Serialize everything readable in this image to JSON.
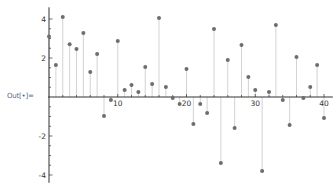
{
  "cell": {
    "output_label": "Out[•]="
  },
  "chart_data": {
    "type": "scatter",
    "style": "stem",
    "title": "",
    "xlabel": "",
    "ylabel": "",
    "xlim": [
      0,
      41
    ],
    "ylim": [
      -4.4,
      4.6
    ],
    "x_ticks": [
      10,
      20,
      30,
      40
    ],
    "y_ticks": [
      -4,
      -2,
      2,
      4
    ],
    "grid": false,
    "legend": null,
    "point_color": "#6e6e6e",
    "stem_color": "#c8c8c8",
    "x": [
      0,
      1,
      2,
      3,
      4,
      5,
      6,
      7,
      8,
      9,
      10,
      11,
      12,
      13,
      14,
      15,
      16,
      17,
      18,
      19,
      20,
      21,
      22,
      23,
      24,
      25,
      26,
      27,
      28,
      29,
      30,
      31,
      32,
      33,
      34,
      35,
      36,
      37,
      38,
      39,
      40
    ],
    "values": [
      3.1,
      1.64,
      4.1,
      2.7,
      2.46,
      3.28,
      1.28,
      2.2,
      -0.97,
      -0.15,
      2.87,
      0.36,
      0.62,
      0.26,
      1.54,
      0.67,
      4.05,
      0.51,
      -0.05,
      -0.36,
      1.44,
      -1.38,
      -0.36,
      -0.82,
      3.49,
      -3.38,
      1.9,
      -1.59,
      2.67,
      1.03,
      0.36,
      -3.79,
      0.26,
      3.69,
      -0.15,
      -1.44,
      2.05,
      -0.05,
      0.51,
      1.64,
      -1.08
    ]
  }
}
